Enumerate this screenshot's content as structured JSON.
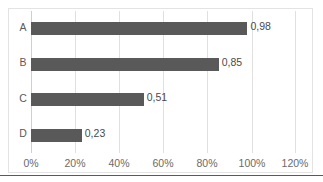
{
  "chart_data": {
    "type": "bar",
    "orientation": "horizontal",
    "title": "",
    "subtitle": "",
    "xlabel": "",
    "ylabel": "",
    "categories": [
      "A",
      "B",
      "C",
      "D"
    ],
    "values": [
      0.98,
      0.85,
      0.51,
      0.23
    ],
    "data_labels": [
      "0,98",
      "0,85",
      "0,51",
      "0,23"
    ],
    "series": [
      {
        "name": "",
        "values": [
          0.98,
          0.85,
          0.51,
          0.23
        ],
        "color": "#595959"
      }
    ],
    "xlim": [
      0,
      1.2
    ],
    "ylim": null,
    "x_tick_values": [
      0,
      0.2,
      0.4,
      0.6,
      0.8,
      1.0,
      1.2
    ],
    "x_tick_labels": [
      "0%",
      "20%",
      "40%",
      "60%",
      "80%",
      "100%",
      "120%"
    ],
    "y_tick_labels": [
      "A",
      "B",
      "C",
      "D"
    ],
    "grid": "vertical",
    "legend": "none",
    "legend_position": "",
    "number_format": "decimal-comma",
    "axis_units": "percent"
  },
  "style": {
    "bar_color": "#595959",
    "gridline_color": "#e0e0e0",
    "axis_color": "#cfcfcf",
    "frame_color": "#e3e3e3",
    "label_color": "#5a5a5a",
    "tick_color": "#6a6a6a",
    "value_color": "#4a4a4a",
    "background": "#ffffff",
    "rule_color": "#5a5a5a"
  }
}
